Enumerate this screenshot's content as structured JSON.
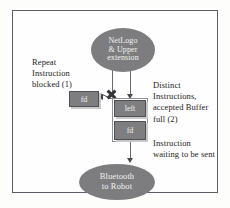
{
  "diagram": {
    "colors": {
      "node_fill": "#7d7d80",
      "node_text": "#f2f2f0",
      "border": "#5d5d66",
      "line": "#6a6a70",
      "block_mark": "#35353b",
      "background": "#fefefe"
    },
    "nodes": {
      "source": {
        "name": "netlogo-upper-extension",
        "shape": "ellipse",
        "line1": "NetLogo",
        "line2": "& Upper",
        "line3": "extension"
      },
      "sink": {
        "name": "bluetooth-to-robot",
        "shape": "ellipse",
        "line1": "Bluetooth",
        "line2": "to Robot"
      },
      "blocked_instruction": {
        "name": "blocked-instruction-fd",
        "shape": "box",
        "label": "fd"
      },
      "buffer_slot_1": {
        "name": "buffer-slot-left",
        "shape": "box",
        "label": "left"
      },
      "buffer_slot_2": {
        "name": "buffer-slot-fd",
        "shape": "box",
        "label": "fd"
      }
    },
    "annotations": {
      "repeat": {
        "name": "repeat-instruction-blocked-note",
        "line1": "Repeat",
        "line2": "Instruction",
        "line3": "blocked (1)"
      },
      "distinct": {
        "name": "distinct-instructions-note",
        "line1": "Distinct",
        "line2": "Instructions,",
        "line3": "accepted Buffer",
        "line4": "full (2)"
      },
      "waiting": {
        "name": "instruction-waiting-note",
        "line1": "Instruction",
        "line2": "waiting to be sent"
      }
    },
    "marks": {
      "block_x": "x-block-mark"
    }
  }
}
